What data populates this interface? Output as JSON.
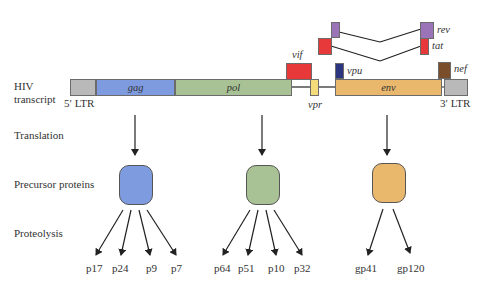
{
  "row_labels": {
    "transcript_line1": "HIV",
    "transcript_line2": "transcript",
    "translation": "Translation",
    "precursor": "Precursor proteins",
    "proteolysis": "Proteolysis"
  },
  "ltr": {
    "five": "5′ LTR",
    "three": "3′ LTR"
  },
  "genes": {
    "gag": "gag",
    "pol": "pol",
    "vif": "vif",
    "vpr": "vpr",
    "vpu": "vpu",
    "env": "env",
    "nef": "nef",
    "rev": "rev",
    "tat": "tat"
  },
  "colors": {
    "ltr": "#b9b9b9",
    "gag": "#7f9be0",
    "pol": "#a8c295",
    "vif": "#e8393a",
    "vpr": "#f5dc7a",
    "vpu": "#2b3580",
    "env": "#eab86c",
    "nef": "#7a4e2a",
    "rev": "#9b74b8",
    "tat": "#e8393a"
  },
  "products": {
    "gag": [
      "p17",
      "p24",
      "p9",
      "p7"
    ],
    "pol": [
      "p64",
      "p51",
      "p10",
      "p32"
    ],
    "env": [
      "gp41",
      "gp120"
    ]
  }
}
